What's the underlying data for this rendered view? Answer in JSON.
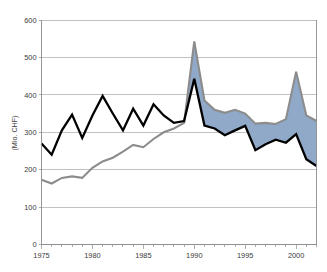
{
  "chart_data": {
    "type": "area",
    "title": "",
    "subtitle": "",
    "xlabel": "",
    "ylabel": "(Mio. CHF)",
    "x": [
      1975,
      1976,
      1977,
      1978,
      1979,
      1980,
      1981,
      1982,
      1983,
      1984,
      1985,
      1986,
      1987,
      1988,
      1989,
      1990,
      1991,
      1992,
      1993,
      1994,
      1995,
      1996,
      1997,
      1998,
      1999,
      2000,
      2001,
      2002
    ],
    "xlim": [
      1975,
      2002
    ],
    "ylim": [
      0,
      600
    ],
    "y_ticks": [
      0,
      100,
      200,
      300,
      400,
      500,
      600
    ],
    "y_tick_labels": [
      "0",
      "100",
      "200",
      "300",
      "400",
      "500",
      "600"
    ],
    "x_ticks": [
      1975,
      1980,
      1985,
      1990,
      1995,
      2000
    ],
    "x_tick_labels": [
      "1975",
      "1980",
      "1985",
      "1990",
      "1995",
      "2000"
    ],
    "x_minor_ticks": [
      1976,
      1977,
      1978,
      1979,
      1981,
      1982,
      1983,
      1984,
      1986,
      1987,
      1988,
      1989,
      1991,
      1992,
      1993,
      1994,
      1996,
      1997,
      1998,
      1999,
      2001,
      2002
    ],
    "grid": true,
    "legend_position": "none",
    "fill_between": true,
    "fill_color": "#90a9c9",
    "series": [
      {
        "name": "upper-gray",
        "color": "#8c8c8c",
        "line_width": 2.1,
        "values": [
          173,
          163,
          178,
          182,
          178,
          205,
          222,
          232,
          248,
          266,
          260,
          282,
          300,
          310,
          325,
          543,
          385,
          360,
          352,
          360,
          350,
          323,
          325,
          322,
          335,
          462,
          345,
          330
        ]
      },
      {
        "name": "lower-black",
        "color": "#000000",
        "line_width": 2.3,
        "values": [
          270,
          240,
          305,
          347,
          285,
          345,
          397,
          350,
          305,
          363,
          318,
          375,
          345,
          325,
          330,
          443,
          318,
          310,
          292,
          305,
          317,
          252,
          268,
          280,
          272,
          295,
          228,
          210
        ]
      }
    ]
  },
  "plot": {
    "axis_color": "#8c8c8c",
    "grid_color": "#a6a6a6",
    "background": "#ffffff"
  }
}
